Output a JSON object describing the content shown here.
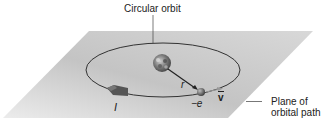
{
  "diagram": {
    "labels": {
      "circular_orbit": "Circular orbit",
      "plane_line1": "Plane of",
      "plane_line2": "orbital path",
      "radius": "r",
      "electron": "−e",
      "velocity": "v",
      "current": "I"
    },
    "colors": {
      "plane_light": "#e6e6e6",
      "plane_dark": "#b8b8b8",
      "orbit": "#333333",
      "arrow": "#555555"
    },
    "icons": {
      "nucleus": "nucleus-sphere",
      "electron": "electron-sphere",
      "current_arrow": "current-arrow-icon",
      "velocity_vector": "vector-arrow"
    }
  }
}
